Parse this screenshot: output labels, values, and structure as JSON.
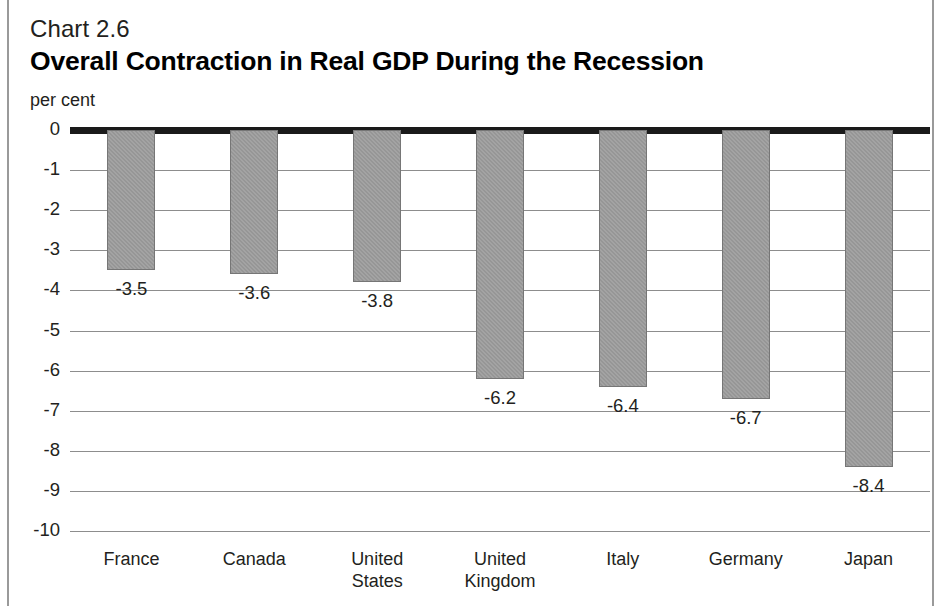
{
  "figure": {
    "chart_number": "Chart 2.6",
    "title": "Overall Contraction in Real GDP During the Recession",
    "unit_label": "per cent",
    "bar_color": "#969696",
    "zero_line_color": "#1a1a1a",
    "grid_color": "#8d8d8d",
    "text_color": "#231f20"
  },
  "chart_data": {
    "type": "bar",
    "title": "Overall Contraction in Real GDP During the Recession",
    "subtitle": "Chart 2.6",
    "xlabel": "",
    "ylabel": "per cent",
    "ylim": [
      -10,
      0
    ],
    "yticks": [
      "0",
      "-1",
      "-2",
      "-3",
      "-4",
      "-5",
      "-6",
      "-7",
      "-8",
      "-9",
      "-10"
    ],
    "ytick_values": [
      0,
      -1,
      -2,
      -3,
      -4,
      -5,
      -6,
      -7,
      -8,
      -9,
      -10
    ],
    "grid": true,
    "legend": null,
    "categories": [
      "France",
      "Canada",
      "United\nStates",
      "United\nKingdom",
      "Italy",
      "Germany",
      "Japan"
    ],
    "values": [
      -3.5,
      -3.6,
      -3.8,
      -6.2,
      -6.4,
      -6.7,
      -8.4
    ],
    "data_labels": [
      "-3.5",
      "-3.6",
      "-3.8",
      "-6.2",
      "-6.4",
      "-6.7",
      "-8.4"
    ]
  }
}
